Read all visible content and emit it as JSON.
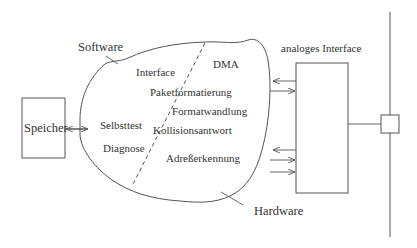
{
  "diagram": {
    "labels": {
      "software": "Software",
      "hardware": "Hardware",
      "speicher": "Speicher",
      "analog_interface": "analoges Interface"
    },
    "software_functions": [
      "Interface",
      "Selbsttest",
      "Diagnose"
    ],
    "hardware_functions": [
      "DMA",
      "Paketformatierung",
      "Formatwandlung",
      "Kollisionsantwort",
      "Adreßerkennung"
    ],
    "colors": {
      "line": "#555555",
      "text": "#333333",
      "background": "#ffffff"
    }
  }
}
